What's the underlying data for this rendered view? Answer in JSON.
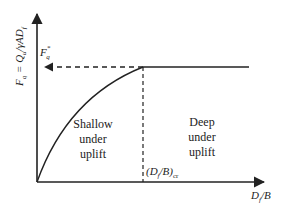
{
  "diagram": {
    "type": "uplift-capacity-vs-embedment",
    "y_axis": {
      "label_main": "F",
      "label_sub": "q",
      "label_eq": " = Q",
      "label_sub2": "u",
      "label_rest": "/γAD",
      "label_sub3": "f"
    },
    "x_axis": {
      "label_main": "D",
      "label_sub": "f",
      "label_rest": "/B"
    },
    "plateau_marker": {
      "main": "F",
      "sub": "q",
      "sup": "*"
    },
    "critical_marker": {
      "open": "(D",
      "sub": "f",
      "mid": "/B)",
      "sub2": "cr"
    },
    "regions": [
      {
        "line1": "Shallow",
        "line2": "under",
        "line3": "uplift"
      },
      {
        "line1": "Deep",
        "line2": "under",
        "line3": "uplift"
      }
    ],
    "colors": {
      "line": "#222222",
      "background": "#ffffff"
    }
  }
}
